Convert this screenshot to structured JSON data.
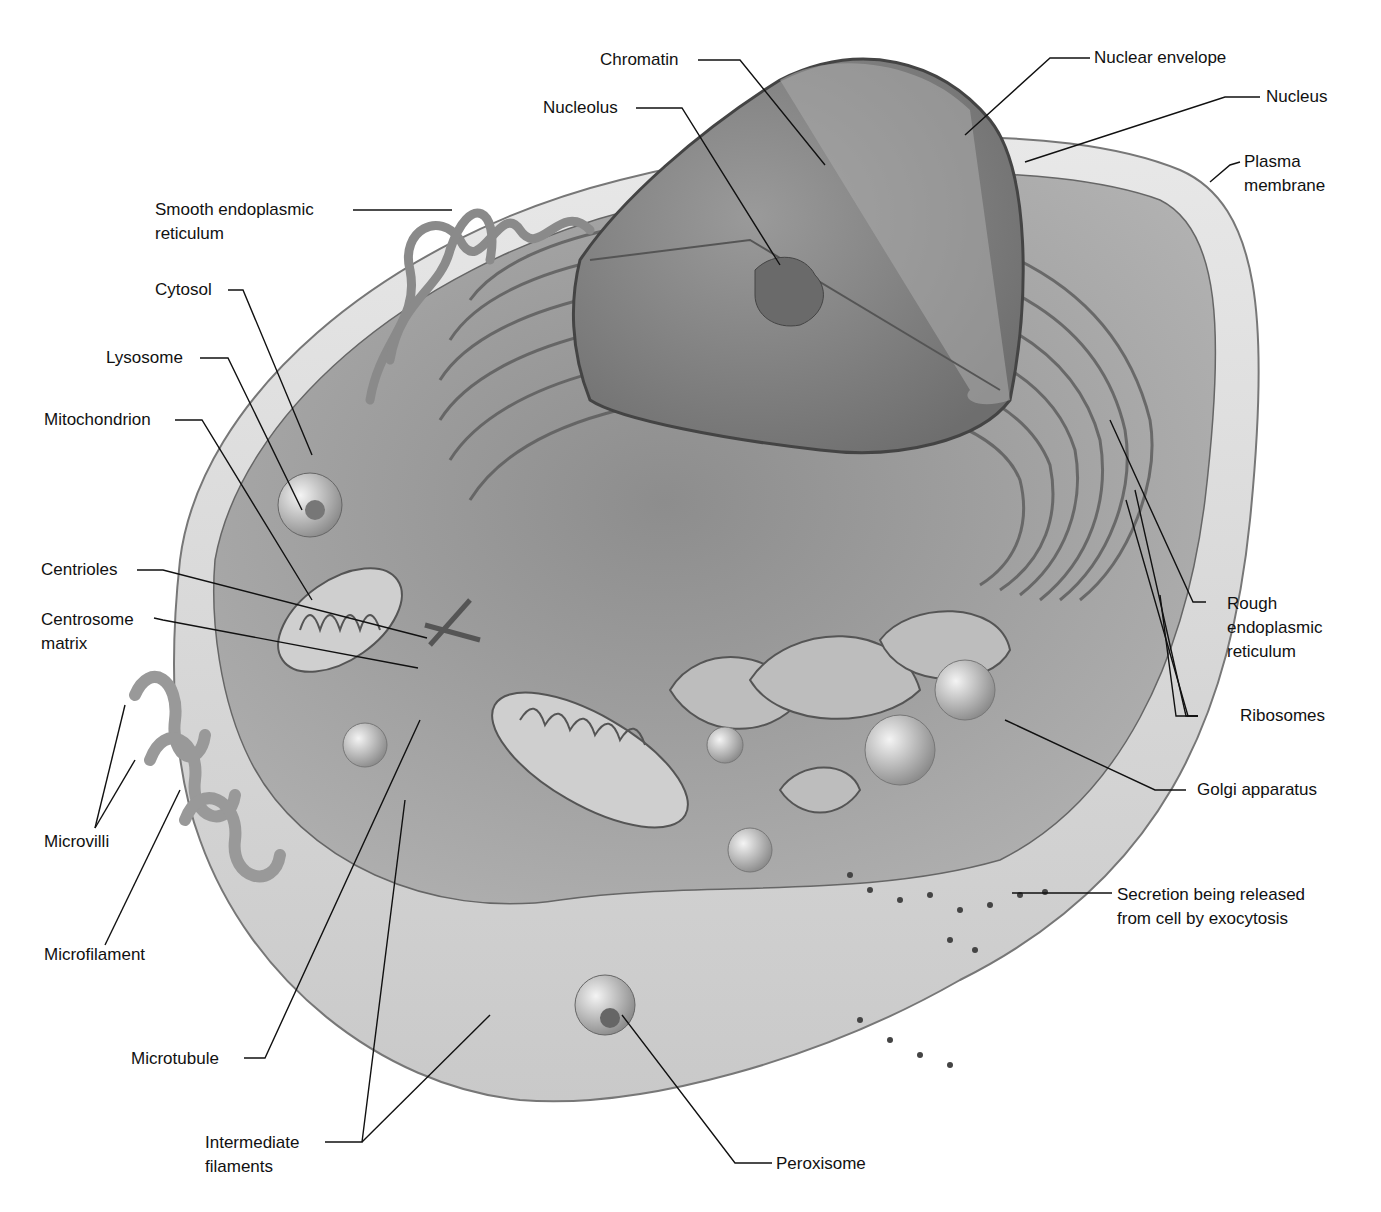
{
  "diagram": {
    "colors": {
      "background": "#ffffff",
      "cell_fill": "#c8c8c8",
      "cytoplasm": "#9a9a9a",
      "nucleus": "#8c8c8c",
      "leader_line": "#111111"
    },
    "labels": {
      "chromatin": "Chromatin",
      "nuclear_envelope": "Nuclear envelope",
      "nucleolus": "Nucleolus",
      "nucleus": "Nucleus",
      "plasma_membrane_1": "Plasma",
      "plasma_membrane_2": "membrane",
      "smooth_er_1": "Smooth endoplasmic",
      "smooth_er_2": "reticulum",
      "cytosol": "Cytosol",
      "lysosome": "Lysosome",
      "mitochondrion": "Mitochondrion",
      "centrioles": "Centrioles",
      "centrosome_matrix_1": "Centrosome",
      "centrosome_matrix_2": "matrix",
      "rough_er_1": "Rough",
      "rough_er_2": "endoplasmic",
      "rough_er_3": "reticulum",
      "ribosomes": "Ribosomes",
      "golgi": "Golgi apparatus",
      "secretion_1": "Secretion being released",
      "secretion_2": "from cell by exocytosis",
      "microvilli": "Microvilli",
      "microfilament": "Microfilament",
      "microtubule": "Microtubule",
      "intermediate_1": "Intermediate",
      "intermediate_2": "filaments",
      "peroxisome": "Peroxisome"
    }
  }
}
